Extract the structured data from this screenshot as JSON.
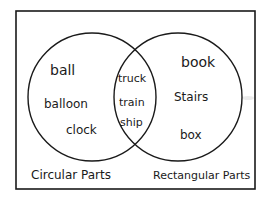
{
  "diagram": {
    "type": "venn",
    "sets": [
      {
        "name": "left",
        "label": "Circular Parts",
        "items": [
          "ball",
          "balloon",
          "clock"
        ]
      },
      {
        "name": "right",
        "label": "Rectangular Parts",
        "items": [
          "book",
          "Stairs",
          "box"
        ]
      }
    ],
    "intersection": {
      "items": [
        "truck",
        "train",
        "ship"
      ]
    }
  },
  "colors": {
    "ink": "#1a1a1a",
    "background": "#ffffff"
  }
}
